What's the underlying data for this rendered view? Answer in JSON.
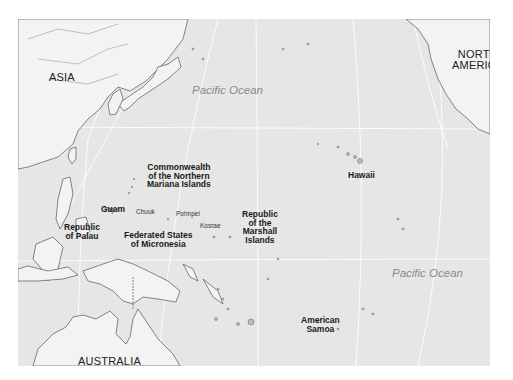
{
  "map": {
    "colors": {
      "ocean": "#e6e6e6",
      "land": "#f3f3f3",
      "coastline": "#555555",
      "graticule": "#ffffff",
      "background": "#ffffff"
    },
    "continents": [
      {
        "id": "asia",
        "label": "ASIA"
      },
      {
        "id": "north-america",
        "label": "NORTH\nAMERICA"
      },
      {
        "id": "australia",
        "label": "AUSTRALIA"
      }
    ],
    "oceans": [
      {
        "id": "pacific-north",
        "label": "Pacific Ocean"
      },
      {
        "id": "pacific-south",
        "label": "Pacific Ocean"
      }
    ],
    "territories": [
      {
        "id": "cnmi",
        "label": "Commonwealth\nof the Northern\nMariana Islands"
      },
      {
        "id": "guam",
        "label": "Guam"
      },
      {
        "id": "palau",
        "label": "Republic\nof Palau"
      },
      {
        "id": "fsm",
        "label": "Federated States\nof Micronesia"
      },
      {
        "id": "marshall",
        "label": "Republic\nof the\nMarshall\nIslands"
      },
      {
        "id": "hawaii",
        "label": "Hawaii"
      },
      {
        "id": "american-samoa",
        "label": "American\nSamoa"
      }
    ],
    "places": [
      {
        "id": "yap",
        "label": "Yap"
      },
      {
        "id": "chuuk",
        "label": "Chuuk"
      },
      {
        "id": "pohnpei",
        "label": "Pohnpei"
      },
      {
        "id": "kosrae",
        "label": "Kosrae"
      }
    ]
  }
}
